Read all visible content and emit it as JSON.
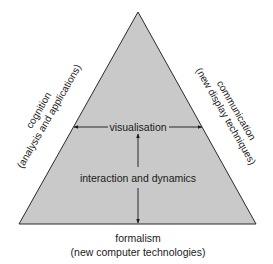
{
  "diagram": {
    "type": "triangle",
    "colors": {
      "fill": "#c9c9c9",
      "stroke": "#2a2a2a",
      "text": "#1a1a1a",
      "arrow": "#1a1a1a"
    },
    "vertices": {
      "apex": [
        138,
        12
      ],
      "bottom_left": [
        19,
        224
      ],
      "bottom_right": [
        256,
        224
      ]
    },
    "center_labels": {
      "top": "visualisation",
      "middle": "interaction and dynamics"
    },
    "left_side": {
      "line1": "cognition",
      "line2": "(analysis and applications)"
    },
    "right_side": {
      "line1": "communication",
      "line2": "(new display techniques)"
    },
    "base": {
      "line1": "formalism",
      "line2": "(new computer technologies)"
    },
    "arrows": [
      {
        "from": "visualisation",
        "to": "left-edge",
        "direction": "left"
      },
      {
        "from": "visualisation",
        "to": "right-edge",
        "direction": "right"
      },
      {
        "from": "interaction and dynamics",
        "to": "visualisation",
        "direction": "up"
      },
      {
        "from": "interaction and dynamics",
        "to": "base",
        "direction": "down"
      }
    ]
  }
}
